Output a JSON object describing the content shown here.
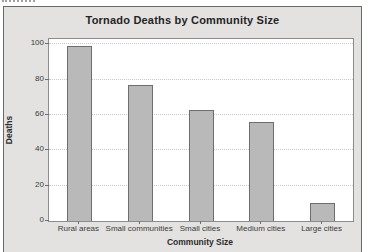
{
  "colors": {
    "window_bg": "#e3e2e0",
    "frame_border": "#6a6a6a",
    "plot_bg": "#ffffff",
    "bar_fill": "#b9b9b9",
    "bar_border": "#6e6e6e",
    "gridline": "#c9c9c9",
    "axis_text": "#3b3b3b"
  },
  "chart_data": {
    "type": "bar",
    "title": "Tornado Deaths by Community Size",
    "xlabel": "Community Size",
    "ylabel": "Deaths",
    "categories": [
      "Rural areas",
      "Small communities",
      "Small cities",
      "Medium cities",
      "Large cities"
    ],
    "values": [
      99,
      77,
      63,
      56,
      10
    ],
    "yticks": [
      0,
      20,
      40,
      60,
      80,
      100
    ],
    "ylim": [
      0,
      103
    ],
    "grid": true,
    "legend": "none"
  }
}
